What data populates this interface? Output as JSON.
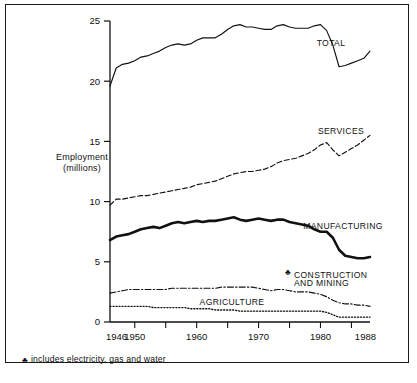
{
  "figure": {
    "frame_color": "#1a1a1a",
    "background": "#ffffff"
  },
  "axis": {
    "y_title_line1": "Employment",
    "y_title_line2": "(millions)",
    "y_ticks": [
      "0",
      "5",
      "10",
      "15",
      "20",
      "25"
    ],
    "x_ticks": [
      "1946",
      "1950",
      "1960",
      "1970",
      "1980",
      "1988"
    ]
  },
  "labels": {
    "total": "TOTAL",
    "services": "SERVICES",
    "manufacturing": "MANUFACTURING",
    "construction_line1": "CONSTRUCTION",
    "construction_line2": "AND MINING",
    "agriculture": "AGRICULTURE",
    "dagger": "♣"
  },
  "footnote": {
    "marker": "♣",
    "text": "includes electricity, gas and water"
  },
  "chart_data": {
    "type": "line",
    "title": "",
    "xlabel": "",
    "ylabel": "Employment (millions)",
    "xlim": [
      1946,
      1988
    ],
    "ylim": [
      0,
      25
    ],
    "grid": false,
    "legend_position": "inline-annotations",
    "x": [
      1946,
      1947,
      1948,
      1949,
      1950,
      1951,
      1952,
      1953,
      1954,
      1955,
      1956,
      1957,
      1958,
      1959,
      1960,
      1961,
      1962,
      1963,
      1964,
      1965,
      1966,
      1967,
      1968,
      1969,
      1970,
      1971,
      1972,
      1973,
      1974,
      1975,
      1976,
      1977,
      1978,
      1979,
      1980,
      1981,
      1982,
      1983,
      1984,
      1985,
      1986,
      1987,
      1988
    ],
    "series": [
      {
        "name": "TOTAL",
        "style": "solid-thin",
        "color": "#111111",
        "values": [
          19.6,
          21.1,
          21.4,
          21.5,
          21.7,
          22.0,
          22.1,
          22.3,
          22.5,
          22.8,
          23.0,
          23.1,
          23.0,
          23.1,
          23.4,
          23.6,
          23.6,
          23.6,
          23.9,
          24.3,
          24.6,
          24.7,
          24.5,
          24.5,
          24.4,
          24.3,
          24.3,
          24.6,
          24.7,
          24.5,
          24.4,
          24.4,
          24.4,
          24.6,
          24.7,
          24.2,
          23.0,
          21.2,
          21.3,
          21.5,
          21.7,
          21.9,
          22.5
        ]
      },
      {
        "name": "SERVICES",
        "style": "dashed",
        "color": "#111111",
        "values": [
          9.7,
          10.2,
          10.2,
          10.3,
          10.4,
          10.5,
          10.5,
          10.6,
          10.7,
          10.8,
          10.9,
          11.0,
          11.1,
          11.2,
          11.4,
          11.5,
          11.6,
          11.7,
          11.9,
          12.1,
          12.3,
          12.4,
          12.5,
          12.5,
          12.6,
          12.7,
          12.9,
          13.2,
          13.4,
          13.5,
          13.6,
          13.8,
          14.0,
          14.3,
          14.7,
          14.9,
          14.3,
          13.8,
          14.1,
          14.4,
          14.7,
          15.1,
          15.5
        ]
      },
      {
        "name": "MANUFACTURING",
        "style": "solid-thick",
        "color": "#111111",
        "values": [
          6.8,
          7.1,
          7.2,
          7.3,
          7.5,
          7.7,
          7.8,
          7.9,
          7.8,
          8.0,
          8.2,
          8.3,
          8.2,
          8.3,
          8.4,
          8.3,
          8.4,
          8.4,
          8.5,
          8.6,
          8.7,
          8.5,
          8.4,
          8.5,
          8.6,
          8.5,
          8.4,
          8.5,
          8.5,
          8.3,
          8.2,
          8.1,
          8.0,
          7.7,
          7.5,
          7.5,
          7.0,
          6.0,
          5.5,
          5.4,
          5.3,
          5.3,
          5.4
        ]
      },
      {
        "name": "CONSTRUCTION AND MINING",
        "style": "dash-dot",
        "color": "#111111",
        "values": [
          2.4,
          2.5,
          2.6,
          2.7,
          2.7,
          2.7,
          2.7,
          2.7,
          2.7,
          2.7,
          2.8,
          2.8,
          2.8,
          2.8,
          2.8,
          2.8,
          2.8,
          2.8,
          2.9,
          2.9,
          2.9,
          2.9,
          2.9,
          2.9,
          2.8,
          2.7,
          2.6,
          2.7,
          2.7,
          2.6,
          2.5,
          2.5,
          2.5,
          2.4,
          2.3,
          2.1,
          1.8,
          1.6,
          1.5,
          1.5,
          1.4,
          1.4,
          1.3
        ]
      },
      {
        "name": "AGRICULTURE",
        "style": "dotted",
        "color": "#111111",
        "values": [
          1.3,
          1.3,
          1.3,
          1.3,
          1.3,
          1.3,
          1.3,
          1.2,
          1.2,
          1.2,
          1.2,
          1.2,
          1.2,
          1.1,
          1.1,
          1.1,
          1.1,
          1.0,
          1.0,
          1.0,
          1.0,
          0.9,
          0.9,
          0.9,
          0.9,
          0.9,
          0.9,
          0.9,
          0.9,
          0.9,
          0.9,
          0.9,
          0.9,
          0.9,
          0.9,
          0.8,
          0.6,
          0.4,
          0.4,
          0.4,
          0.4,
          0.4,
          0.4
        ]
      }
    ]
  }
}
